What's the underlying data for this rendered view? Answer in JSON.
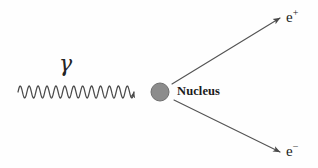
{
  "diagram": {
    "background_color": "#fefefe",
    "stroke_color": "#4a4a4a",
    "text_color": "#1b1b1b",
    "nucleus_fill": "#8c8c8c",
    "nucleus_stroke": "#6f6f6f"
  },
  "labels": {
    "gamma": "γ",
    "nucleus": "Nucleus",
    "positron_base": "e",
    "positron_charge": "+",
    "electron_base": "e",
    "electron_charge": "−"
  },
  "geometry": {
    "photon_wave": {
      "x_start": 18,
      "x_end": 134,
      "baseline_y": 92,
      "amplitude": 6,
      "cycles": 13
    },
    "nucleus": {
      "cx": 160,
      "cy": 92,
      "r": 9
    },
    "positron_arrow": {
      "x1": 172,
      "y1": 84,
      "x2": 280,
      "y2": 18
    },
    "electron_arrow": {
      "x1": 174,
      "y1": 100,
      "x2": 280,
      "y2": 152
    }
  }
}
